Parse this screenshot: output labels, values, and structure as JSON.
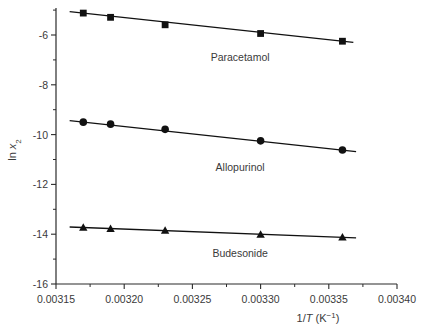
{
  "chart_data": {
    "type": "scatter",
    "title": "",
    "subtitle": "",
    "xlabel": "1/T (K⁻¹)",
    "ylabel": "ln x₂",
    "xlim": [
      0.00315,
      0.0034
    ],
    "ylim": [
      -16,
      -5
    ],
    "grid": false,
    "legend_position": "inline-annotations",
    "xticks": [
      0.00315,
      0.0032,
      0.00325,
      0.0033,
      0.00335,
      0.0034
    ],
    "xtick_labels": [
      "0.00315",
      "0.00320",
      "0.00325",
      "0.00330",
      "0.00335",
      "0.00340"
    ],
    "xminor_ticks": [
      0.003175,
      0.003225,
      0.003275,
      0.003325,
      0.003375
    ],
    "yticks": [
      -6,
      -8,
      -10,
      -12,
      -14,
      -16
    ],
    "ytick_labels": [
      "-6",
      "-8",
      "-10",
      "-12",
      "-14",
      "-16"
    ],
    "yminor_ticks": [
      -5,
      -7,
      -9,
      -11,
      -13,
      -15
    ],
    "series": [
      {
        "name": "Paracetamol",
        "marker": "square",
        "color": "#111111",
        "label_x": 0.003285,
        "label_y": -7.05,
        "x": [
          0.00317,
          0.00319,
          0.00323,
          0.0033,
          0.00336
        ],
        "y": [
          -5.12,
          -5.29,
          -5.59,
          -5.94,
          -6.25
        ],
        "fit": {
          "x": [
            0.00316,
            0.003368
          ],
          "y": [
            -5.06,
            -6.3
          ]
        }
      },
      {
        "name": "Allopurinol",
        "marker": "circle",
        "color": "#111111",
        "label_x": 0.003285,
        "label_y": -11.45,
        "x": [
          0.00317,
          0.00319,
          0.00323,
          0.0033,
          0.00336
        ],
        "y": [
          -9.5,
          -9.58,
          -9.79,
          -10.25,
          -10.62
        ],
        "fit": {
          "x": [
            0.00316,
            0.00337
          ],
          "y": [
            -9.44,
            -10.68
          ]
        }
      },
      {
        "name": "Budesonide",
        "marker": "triangle",
        "color": "#111111",
        "label_x": 0.003285,
        "label_y": -14.92,
        "x": [
          0.00317,
          0.00319,
          0.00323,
          0.0033,
          0.00336
        ],
        "y": [
          -13.73,
          -13.78,
          -13.85,
          -14.01,
          -14.12
        ],
        "fit": {
          "x": [
            0.00316,
            0.00337
          ],
          "y": [
            -13.71,
            -14.15
          ]
        }
      }
    ]
  }
}
